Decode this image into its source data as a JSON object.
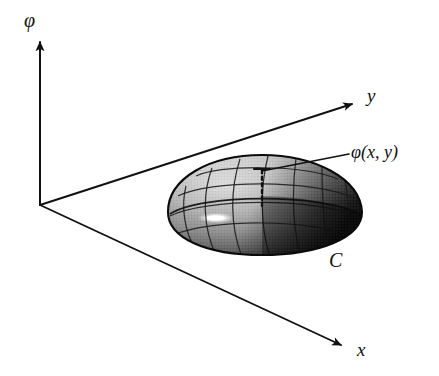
{
  "figure": {
    "background_color": "#ffffff",
    "ink_color": "#111111",
    "axes": {
      "vertical": {
        "name": "phi-axis",
        "label": "φ",
        "direction": "up",
        "origin": [
          40,
          205
        ],
        "tip": [
          40,
          38
        ]
      },
      "depth": {
        "name": "y-axis",
        "label": "y",
        "direction": "up-right",
        "origin": [
          40,
          205
        ],
        "tip": [
          358,
          102
        ]
      },
      "horizontal": {
        "name": "x-axis",
        "label": "x",
        "direction": "down-right",
        "origin": [
          40,
          205
        ],
        "tip": [
          346,
          348
        ]
      }
    },
    "surface": {
      "name": "dome",
      "label": "C",
      "label_position": [
        337,
        262
      ],
      "description": "shaded ellipsoidal cap with wireframe mesh of meridians and parallels",
      "shading": "light on upper-left, dark on right",
      "highlight_color": "#ffffff",
      "light_tone": "#cfcfcf",
      "mid_tone": "#8a8a8a",
      "dark_tone": "#141414",
      "bounds": {
        "center": [
          262,
          212
        ],
        "rx": 97,
        "ry": 43,
        "top": 158,
        "bottom": 255,
        "left": 168,
        "right": 365
      }
    },
    "annotation": {
      "name": "phi-function-callout",
      "label": "φ(x, y)",
      "label_position": [
        351,
        143
      ],
      "leader_from": [
        348,
        155
      ],
      "leader_to": [
        262,
        172
      ],
      "height_line": {
        "name": "height-drop-line",
        "style": "dotted",
        "from": [
          262,
          168
        ],
        "to": [
          262,
          206
        ],
        "tick_half_width": 7
      }
    }
  }
}
